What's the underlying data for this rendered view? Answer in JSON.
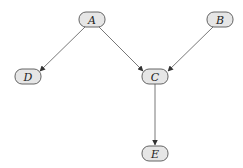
{
  "diagram": {
    "type": "directed-graph",
    "colors": {
      "node_fill": "#e6e6e6",
      "node_stroke": "#555555",
      "edge": "#555555",
      "text": "#222222"
    },
    "nodes": [
      {
        "id": "A",
        "label": "A",
        "cx": 92,
        "cy": 19
      },
      {
        "id": "B",
        "label": "B",
        "cx": 220,
        "cy": 19
      },
      {
        "id": "D",
        "label": "D",
        "cx": 28,
        "cy": 76
      },
      {
        "id": "C",
        "label": "C",
        "cx": 155,
        "cy": 76
      },
      {
        "id": "E",
        "label": "E",
        "cx": 155,
        "cy": 153
      }
    ],
    "edges": [
      {
        "from": "A",
        "to": "D"
      },
      {
        "from": "A",
        "to": "C"
      },
      {
        "from": "B",
        "to": "C"
      },
      {
        "from": "C",
        "to": "E"
      }
    ]
  }
}
